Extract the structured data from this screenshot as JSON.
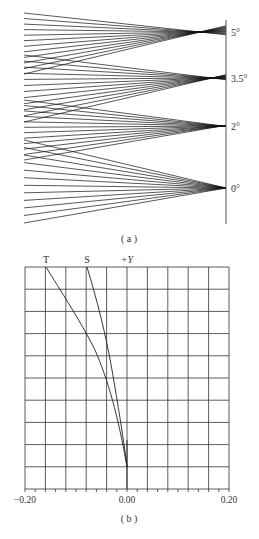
{
  "panel_a": {
    "caption": "( a )",
    "field_angles": [
      {
        "label": "5°",
        "y": 32,
        "focus_x": 200,
        "top": 13,
        "bottom": 74
      },
      {
        "label": "3.5°",
        "y": 78,
        "focus_x": 212,
        "top": 55,
        "bottom": 122
      },
      {
        "label": "2°",
        "y": 126,
        "focus_x": 222,
        "top": 100,
        "bottom": 160
      },
      {
        "label": "0°",
        "y": 188,
        "focus_x": 226,
        "top": 140,
        "bottom": 223
      }
    ]
  },
  "panel_b": {
    "caption": "( b )",
    "curve_labels": {
      "t": "T",
      "s": "S",
      "axis": "+Y"
    },
    "x_ticks": [
      "−0.20",
      "0.00",
      "0.20"
    ]
  },
  "chart_data": {
    "type": "line",
    "xlabel": "",
    "ylabel": "+Y",
    "xlim": [
      -0.2,
      0.2
    ],
    "ylim": [
      0,
      1
    ],
    "grid": true,
    "x_tick_labels": [
      "-0.20",
      "0.00",
      "0.20"
    ],
    "series": [
      {
        "name": "T",
        "points": [
          [
            0.0,
            0.1
          ],
          [
            -0.014,
            0.26
          ],
          [
            -0.028,
            0.41
          ],
          [
            -0.043,
            0.5
          ],
          [
            -0.08,
            0.71
          ],
          [
            -0.12,
            0.9
          ],
          [
            -0.16,
            1.0
          ]
        ]
      },
      {
        "name": "S",
        "points": [
          [
            0.0,
            0.1
          ],
          [
            -0.012,
            0.26
          ],
          [
            -0.027,
            0.5
          ],
          [
            -0.041,
            0.7
          ],
          [
            -0.06,
            0.85
          ],
          [
            -0.08,
            1.0
          ]
        ]
      }
    ]
  }
}
